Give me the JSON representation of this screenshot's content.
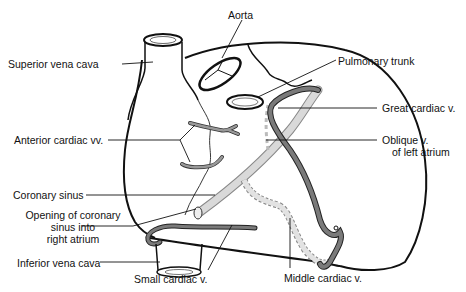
{
  "figure": {
    "colors": {
      "ink": "#111111",
      "vein_dark": "#7a7a7a",
      "vein_light": "#d6d6d6",
      "background": "#ffffff"
    }
  },
  "labels": {
    "aorta": "Aorta",
    "superior_vena_cava": "Superior vena cava",
    "pulmonary_trunk": "Pulmonary trunk",
    "great_cardiac_v": "Great cardiac v.",
    "anterior_cardiac_vv": "Anterior cardiac vv.",
    "oblique_v_line1": "Oblique v.",
    "oblique_v_line2": "of left atrium",
    "coronary_sinus": "Coronary sinus",
    "opening_line1": "Opening of coronary",
    "opening_line2": "sinus into",
    "opening_line3": "right atrium",
    "inferior_vena_cava": "Inferior vena cava",
    "small_cardiac_v": "Small cardiac v.",
    "middle_cardiac_v": "Middle cardiac v."
  }
}
